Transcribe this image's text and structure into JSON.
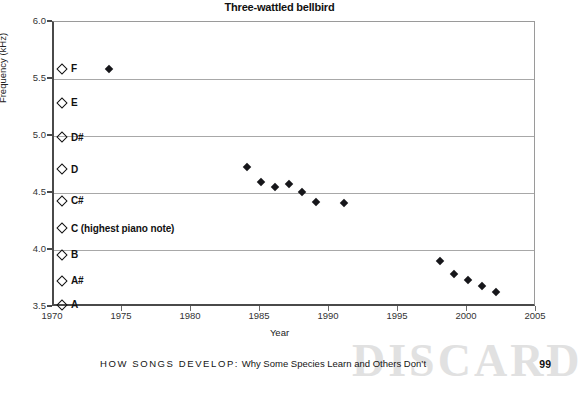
{
  "chart_data": {
    "type": "scatter",
    "title": "Three-wattled bellbird",
    "xlabel": "Year",
    "ylabel": "Frequency (kHz)",
    "xlim": [
      1970,
      2005
    ],
    "ylim": [
      3.5,
      6.0
    ],
    "grid": true,
    "legend_position": "none",
    "xticks": [
      1970,
      1975,
      1980,
      1985,
      1990,
      1995,
      2000,
      2005
    ],
    "xtick_labels": [
      "1970",
      "1975",
      "1980",
      "1985",
      "1990",
      "1995",
      "2000",
      "2005"
    ],
    "yticks": [
      3.5,
      4.0,
      4.5,
      5.0,
      5.5,
      6.0
    ],
    "ytick_labels": [
      "3.5",
      "4.0",
      "4.5",
      "5.0",
      "5.5",
      "6.0"
    ],
    "series": [
      {
        "name": "Bellbird song frequency",
        "marker": "filled-diamond",
        "color": "#16161a",
        "points": [
          {
            "x": 1974.0,
            "y": 5.59
          },
          {
            "x": 1984.0,
            "y": 4.73
          },
          {
            "x": 1985.0,
            "y": 4.6
          },
          {
            "x": 1986.0,
            "y": 4.55
          },
          {
            "x": 1987.0,
            "y": 4.58
          },
          {
            "x": 1988.0,
            "y": 4.51
          },
          {
            "x": 1989.0,
            "y": 4.42
          },
          {
            "x": 1991.0,
            "y": 4.41
          },
          {
            "x": 1998.0,
            "y": 3.9
          },
          {
            "x": 1999.0,
            "y": 3.79
          },
          {
            "x": 2000.0,
            "y": 3.74
          },
          {
            "x": 2001.0,
            "y": 3.68
          },
          {
            "x": 2002.0,
            "y": 3.63
          }
        ]
      }
    ],
    "note_markers": {
      "marker": "open-diamond",
      "color": "#111111",
      "items": [
        {
          "label": "F",
          "y": 5.59
        },
        {
          "label": "E",
          "y": 5.29
        },
        {
          "label": "D#",
          "y": 4.99
        },
        {
          "label": "D",
          "y": 4.71
        },
        {
          "label": "C#",
          "y": 4.43
        },
        {
          "label": "C (highest piano note)",
          "y": 4.19
        },
        {
          "label": "B",
          "y": 3.96
        },
        {
          "label": "A#",
          "y": 3.73
        },
        {
          "label": "A",
          "y": 3.52
        }
      ]
    }
  },
  "footer": {
    "kicker": "HOW SONGS DEVELOP:",
    "text": "Why Some Species Learn and Others Don’t",
    "page_number": "99",
    "watermark": "DISCARD"
  }
}
